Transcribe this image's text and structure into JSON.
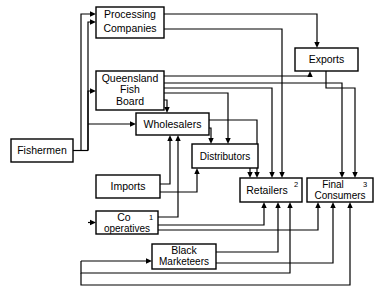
{
  "diagram": {
    "type": "flow-diagram",
    "background_color": "#ffffff",
    "line_color": "#000000",
    "box_fill": "#ffffff",
    "nodes": [
      {
        "id": "fishermen",
        "label": "Fishermen",
        "lines": [
          "Fishermen"
        ],
        "superscript": "",
        "x": 11,
        "y": 139,
        "w": 62,
        "h": 23
      },
      {
        "id": "processing",
        "label": "Processing Companies",
        "lines": [
          "Processing",
          "Companies"
        ],
        "superscript": "",
        "x": 96,
        "y": 7,
        "w": 68,
        "h": 31
      },
      {
        "id": "qfb",
        "label": "Queensland Fish Board",
        "lines": [
          "Queensland",
          "Fish",
          "Board"
        ],
        "superscript": "",
        "x": 96,
        "y": 71,
        "w": 68,
        "h": 39
      },
      {
        "id": "exports",
        "label": "Exports",
        "lines": [
          "Exports"
        ],
        "superscript": "",
        "x": 295,
        "y": 48,
        "w": 63,
        "h": 23
      },
      {
        "id": "wholesalers",
        "label": "Wholesalers",
        "lines": [
          "Wholesalers"
        ],
        "superscript": "",
        "x": 136,
        "y": 113,
        "w": 73,
        "h": 22
      },
      {
        "id": "distributors",
        "label": "Distributors",
        "lines": [
          "Distributors"
        ],
        "superscript": "",
        "x": 192,
        "y": 144,
        "w": 66,
        "h": 24
      },
      {
        "id": "imports",
        "label": "Imports",
        "lines": [
          "Imports"
        ],
        "superscript": "",
        "x": 96,
        "y": 175,
        "w": 64,
        "h": 23
      },
      {
        "id": "retailers",
        "label": "Retailers",
        "lines": [
          "Retailers"
        ],
        "superscript": "2",
        "x": 240,
        "y": 178,
        "w": 62,
        "h": 24
      },
      {
        "id": "consumers",
        "label": "Final Consumers",
        "lines": [
          "Final",
          "Consumers"
        ],
        "superscript": "3",
        "x": 307,
        "y": 178,
        "w": 66,
        "h": 24
      },
      {
        "id": "cooperatives",
        "label": "Co-operatives",
        "lines": [
          "Co",
          "operatives"
        ],
        "superscript": "1",
        "x": 96,
        "y": 211,
        "w": 62,
        "h": 23
      },
      {
        "id": "blackmarket",
        "label": "Black Marketeers",
        "lines": [
          "Black",
          "Marketeers"
        ],
        "superscript": "",
        "x": 152,
        "y": 244,
        "w": 64,
        "h": 25
      }
    ],
    "footnote_markers": [
      "1",
      "2",
      "3"
    ],
    "edges": [
      {
        "from": "fishermen",
        "to": "processing"
      },
      {
        "from": "fishermen",
        "to": "qfb"
      },
      {
        "from": "fishermen",
        "to": "wholesalers"
      },
      {
        "from": "fishermen",
        "to": "cooperatives"
      },
      {
        "from": "fishermen",
        "to": "blackmarket"
      },
      {
        "from": "processing",
        "to": "exports"
      },
      {
        "from": "processing",
        "to": "retailers"
      },
      {
        "from": "qfb",
        "to": "exports"
      },
      {
        "from": "qfb",
        "to": "wholesalers"
      },
      {
        "from": "qfb",
        "to": "retailers"
      },
      {
        "from": "qfb",
        "to": "consumers"
      },
      {
        "from": "exports",
        "to": "consumers"
      },
      {
        "from": "wholesalers",
        "to": "distributors"
      },
      {
        "from": "wholesalers",
        "to": "retailers"
      },
      {
        "from": "imports",
        "to": "wholesalers"
      },
      {
        "from": "imports",
        "to": "distributors"
      },
      {
        "from": "cooperatives",
        "to": "wholesalers"
      },
      {
        "from": "cooperatives",
        "to": "retailers"
      },
      {
        "from": "cooperatives",
        "to": "consumers"
      },
      {
        "from": "distributors",
        "to": "retailers"
      },
      {
        "from": "blackmarket",
        "to": "retailers"
      },
      {
        "from": "blackmarket",
        "to": "consumers"
      },
      {
        "from": "retailers",
        "to": "consumers"
      }
    ]
  }
}
